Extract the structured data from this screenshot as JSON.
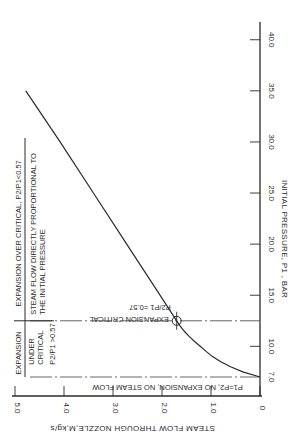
{
  "chart_data": {
    "type": "line",
    "title": "",
    "orientation": "rotated-90",
    "xlabel": "INITIAL PRESSURE, P1 , BAR",
    "ylabel": "STEAM FLOW THROUGH NOZZLE,M,kg/s",
    "xlim": [
      7.0,
      42.0
    ],
    "ylim": [
      0,
      5.0
    ],
    "x_ticks": [
      7.0,
      10.0,
      15.0,
      20.0,
      25.0,
      30.0,
      35.0,
      40.0
    ],
    "x_tick_labels": [
      "7.0",
      "10.0",
      "15.0",
      "20.0",
      "25.0",
      "30.0",
      "35.0",
      "40.0"
    ],
    "y_ticks": [
      0,
      1.0,
      2.0,
      3.0,
      4.0,
      5.0
    ],
    "y_tick_labels": [
      "0",
      "1.0",
      "2.0",
      "3.0",
      "4.0",
      "5.0"
    ],
    "grid": false,
    "series": [
      {
        "name": "Steam flow",
        "x": [
          7.0,
          7.5,
          8.0,
          8.5,
          9.0,
          9.5,
          10.0,
          10.5,
          11.0,
          11.5,
          12.0,
          12.5,
          15.0,
          20.0,
          25.0,
          30.0,
          35.0
        ],
        "y": [
          0.0,
          0.35,
          0.6,
          0.8,
          0.97,
          1.1,
          1.22,
          1.34,
          1.45,
          1.55,
          1.63,
          1.7,
          2.04,
          2.72,
          3.4,
          4.08,
          4.78
        ]
      }
    ],
    "critical_point": {
      "x": 12.5,
      "y": 1.7
    },
    "annotations": {
      "critical_line": "EXPANSION CRITICAL",
      "critical_ratio": "P2/P1 =0.57",
      "no_flow_line": "P1=P2, NO EXPANSION, NO STEAM FLOW",
      "region_under_header": "EXPANSION",
      "region_under_body_1": "UNDER",
      "region_under_body_2": "CRITICAL",
      "region_under_ratio": "P2/P1 >0.57",
      "region_over_header": "EXPANSION OVER CRITICAL, P2/P1<0.57",
      "region_over_body_1": "STEAM FLOW DIRECTLY PROPORTIONAL TO",
      "region_over_body_2": "THE INITIAL PRESSURE"
    },
    "colors": {
      "ink": "#2a2a2a",
      "background": "#ffffff"
    }
  }
}
